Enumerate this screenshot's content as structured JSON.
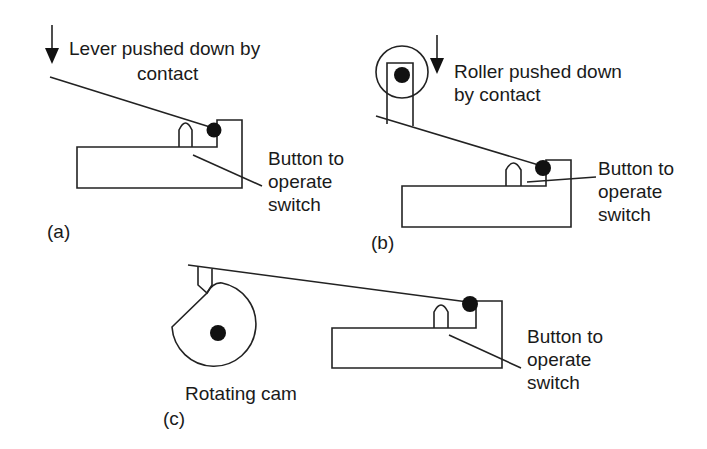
{
  "figure": {
    "panels": [
      {
        "id": "a",
        "caption": "(a)",
        "title_lines": [
          "Lever pushed down by",
          "contact"
        ],
        "callout_lines": [
          "Button to",
          "operate",
          "switch"
        ]
      },
      {
        "id": "b",
        "caption": "(b)",
        "title_lines": [
          "Roller pushed down",
          "by contact"
        ],
        "callout_lines": [
          "Button to",
          "operate",
          "switch"
        ]
      },
      {
        "id": "c",
        "caption": "(c)",
        "cam_label": "Rotating cam",
        "callout_lines": [
          "Button to",
          "operate",
          "switch"
        ]
      }
    ],
    "icons": [
      "down-arrow-icon",
      "pivot-dot-icon",
      "roller-icon",
      "cam-icon"
    ],
    "colors": {
      "line": "#222222",
      "fill": "#111111",
      "background": "#ffffff"
    }
  }
}
